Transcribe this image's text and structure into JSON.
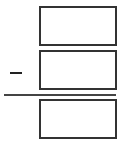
{
  "problem": {
    "type": "vertical-subtraction",
    "operator": "minus",
    "operator_symbol": "−",
    "minuend": {
      "value": "",
      "placeholder": ""
    },
    "subtrahend": {
      "value": "",
      "placeholder": ""
    },
    "difference": {
      "value": "",
      "placeholder": ""
    }
  },
  "colors": {
    "border": "#333333",
    "rule": "#444444",
    "background": "#ffffff"
  }
}
